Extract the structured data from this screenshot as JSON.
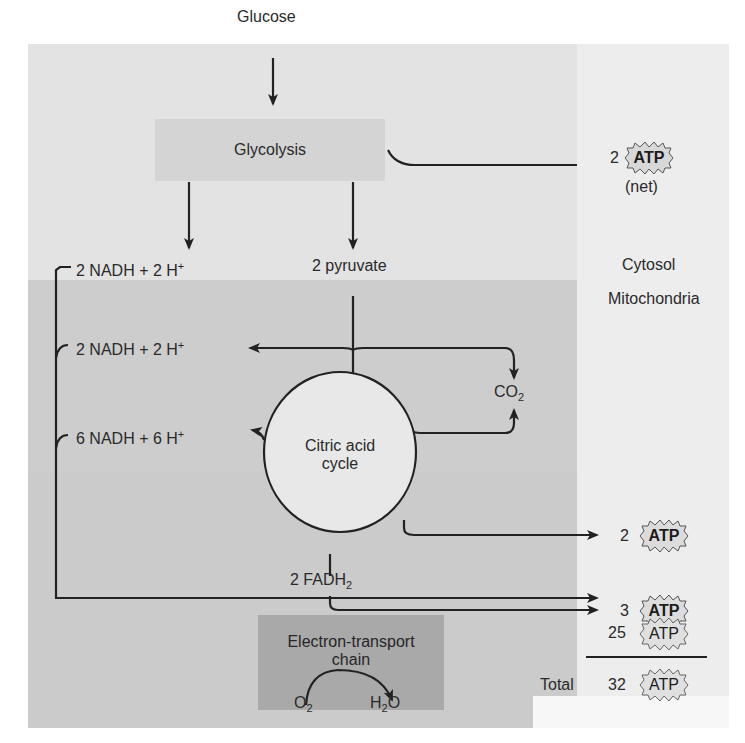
{
  "regions": {
    "cytosol_label": "Cytosol",
    "mitochondria_label": "Mitochondria"
  },
  "nodes": {
    "glucose": "Glucose",
    "glycolysis": "Glycolysis",
    "pyruvate": "2 pyruvate",
    "citric_acid_cycle_line1": "Citric acid",
    "citric_acid_cycle_line2": "cycle",
    "etc_line1": "Electron-transport",
    "etc_line2": "chain",
    "fadh2": "2 FADH",
    "fadh2_sub": "2",
    "co2": "CO",
    "co2_sub": "2",
    "o2": "O",
    "o2_sub": "2",
    "h2o_h": "H",
    "h2o_sub": "2",
    "h2o_o": "O"
  },
  "nadh": {
    "glycolysis": {
      "text": "2 NADH + 2 H",
      "sup": "+"
    },
    "pyruvate_ox": {
      "text": "2 NADH + 2 H",
      "sup": "+"
    },
    "cycle": {
      "text": "6 NADH + 6 H",
      "sup": "+"
    }
  },
  "atp_yields": {
    "glycolysis": {
      "count": "2",
      "unit": "ATP",
      "note": "(net)"
    },
    "citric_acid_cycle": {
      "count": "2",
      "unit": "ATP"
    },
    "fadh2": {
      "count": "3",
      "unit": "ATP"
    },
    "nadh": {
      "count": "25",
      "unit": "ATP"
    },
    "total": {
      "label": "Total",
      "count": "32",
      "unit": "ATP"
    }
  },
  "colors": {
    "cytosol_bg": "#e3e3e3",
    "mitochondria_bg": "#cdcdcd",
    "right_column_bg": "#ededed",
    "glycolysis_box": "#d4d4d4",
    "etc_box": "#a9a9a9",
    "cycle_fill": "#e8e8e8",
    "line": "#222222"
  }
}
